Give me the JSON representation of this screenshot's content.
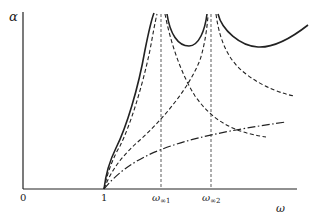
{
  "diagram": {
    "y_axis_label": "α",
    "x_axis_label": "ω",
    "origin_label": "0",
    "tick_labels": {
      "one": "1",
      "omega_inf1_base": "ω",
      "omega_inf1_sub": "∞1",
      "omega_inf2_base": "ω",
      "omega_inf2_sub": "∞2"
    },
    "line_color": "#222222",
    "curves": [
      {
        "name": "total-attenuation",
        "style": "solid"
      },
      {
        "name": "section-1-attenuation",
        "style": "dashed"
      },
      {
        "name": "section-2-attenuation",
        "style": "dashed"
      },
      {
        "name": "section-3-attenuation",
        "style": "dash-dot"
      }
    ],
    "asymptotes": [
      "ω∞1",
      "ω∞2"
    ]
  }
}
